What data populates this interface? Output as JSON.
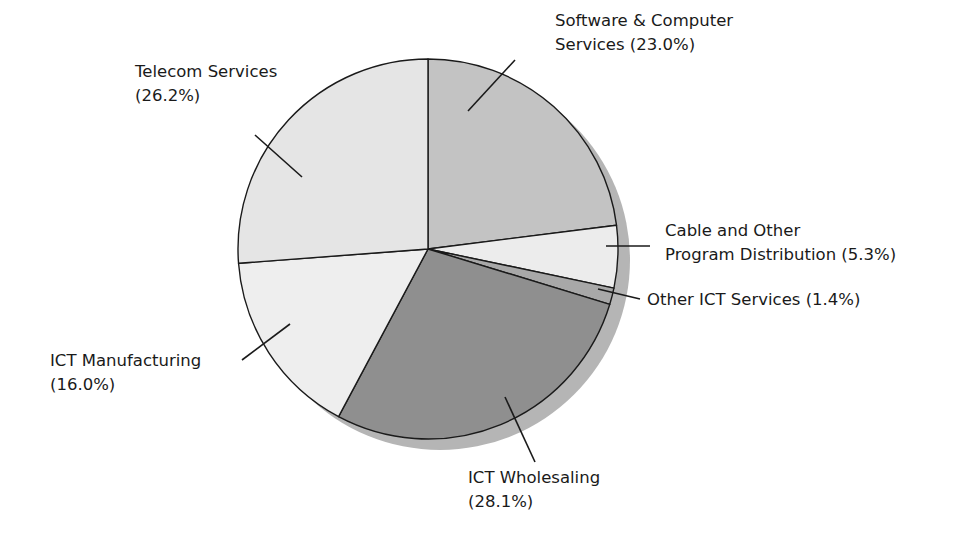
{
  "chart_data": {
    "type": "pie",
    "title": "",
    "start": "top",
    "direction": "clockwise",
    "unit": "%",
    "slices": [
      {
        "name": "Software & Computer Services",
        "value": 23.0,
        "label_lines": [
          "Software & Computer",
          "Services (23.0%)"
        ],
        "color": "#c3c3c3"
      },
      {
        "name": "Cable and Other Program Distribution",
        "value": 5.3,
        "label_lines": [
          "Cable and Other",
          "Program Distribution (5.3%)"
        ],
        "color": "#ececec"
      },
      {
        "name": "Other ICT Services",
        "value": 1.4,
        "label_lines": [
          "Other ICT Services (1.4%)"
        ],
        "color": "#a8a8a8"
      },
      {
        "name": "ICT Wholesaling",
        "value": 28.1,
        "label_lines": [
          "ICT Wholesaling",
          "(28.1%)"
        ],
        "color": "#8f8f8f"
      },
      {
        "name": "ICT Manufacturing",
        "value": 16.0,
        "label_lines": [
          "ICT Manufacturing",
          "(16.0%)"
        ],
        "color": "#eeeeee"
      },
      {
        "name": "Telecom Services",
        "value": 26.2,
        "label_lines": [
          "Telecom Services",
          "(26.2%)"
        ],
        "color": "#e5e5e5"
      }
    ],
    "shadow_color": "#b5b5b5",
    "outline_color": "#1a1a1a"
  }
}
